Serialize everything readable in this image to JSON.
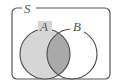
{
  "diagram": {
    "type": "venn",
    "universe": {
      "label": "S"
    },
    "sets": [
      {
        "label": "A",
        "shaded": true,
        "fill": "#d6d6d6"
      },
      {
        "label": "B",
        "shaded": false,
        "fill": "#ffffff"
      }
    ],
    "intersection": {
      "shaded": true,
      "fill": "#a9a9a9"
    },
    "stroke": "#555555"
  }
}
